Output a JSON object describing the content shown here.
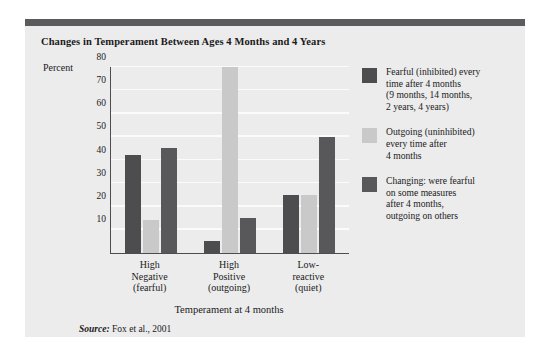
{
  "figure": {
    "title": "Changes in Temperament Between Ages 4 Months and 4 Years",
    "source_prefix": "Source:",
    "source_text": " Fox et al., 2001"
  },
  "colors": {
    "panel_background": "#ececed",
    "header_bar": "#5b5b5e",
    "axis": "#4d4d4f",
    "gridline": "#fbfbfb",
    "series_fearful": "#4d4d4f",
    "series_outgoing": "#c9c9c9",
    "series_changing": "#58585b",
    "text": "#1a1a1a"
  },
  "chart_data": {
    "type": "bar",
    "title": "Changes in Temperament Between Ages 4 Months and 4 Years",
    "xlabel": "Temperament at 4 months",
    "ylabel": "Percent",
    "ylim": [
      0,
      80
    ],
    "yticks": [
      10,
      20,
      30,
      40,
      50,
      60,
      70,
      80
    ],
    "grid": true,
    "legend_position": "right",
    "categories": [
      "High Negative (fearful)",
      "High Positive (outgoing)",
      "Low-reactive (quiet)"
    ],
    "category_lines": [
      [
        "High",
        "Negative",
        "(fearful)"
      ],
      [
        "High",
        "Positive",
        "(outgoing)"
      ],
      [
        "Low-",
        "reactive",
        "(quiet)"
      ]
    ],
    "series": [
      {
        "name": "Fearful (inhibited) every time after 4 months (9 months, 14 months, 2 years, 4 years)",
        "color": "#4d4d4f",
        "values": [
          42,
          5,
          25
        ]
      },
      {
        "name": "Outgoing (uninhibited) every time after 4 months",
        "color": "#c9c9c9",
        "values": [
          14,
          80,
          25
        ]
      },
      {
        "name": "Changing: were fearful on some measures after 4 months, outgoing on others",
        "color": "#58585b",
        "values": [
          45,
          15,
          50
        ]
      }
    ]
  },
  "legend": {
    "entries": [
      {
        "swatch_color": "#4d4d4f",
        "lines": [
          "Fearful (inhibited) every",
          "time after 4 months",
          "(9 months, 14 months,",
          "2 years, 4 years)"
        ]
      },
      {
        "swatch_color": "#c9c9c9",
        "lines": [
          "Outgoing (uninhibited)",
          "every time after",
          "4 months"
        ]
      },
      {
        "swatch_color": "#58585b",
        "lines": [
          "Changing: were fearful",
          "on some measures",
          "after 4 months,",
          "outgoing on others"
        ]
      }
    ]
  }
}
